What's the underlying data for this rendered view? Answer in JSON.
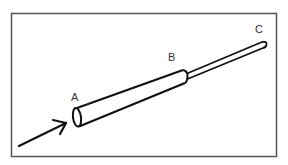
{
  "diagram": {
    "type": "tube-schematic",
    "labels": {
      "a": "A",
      "b": "B",
      "c": "C"
    },
    "elements": [
      {
        "name": "input-arrow",
        "description": "arrow pointing into opening A"
      },
      {
        "name": "wide-tube",
        "description": "wide cylindrical section from A to B"
      },
      {
        "name": "narrow-tube",
        "description": "narrow cylindrical section from B to C"
      }
    ],
    "colors": {
      "stroke": "#111111",
      "frame": "#555555",
      "background": "#ffffff"
    }
  }
}
